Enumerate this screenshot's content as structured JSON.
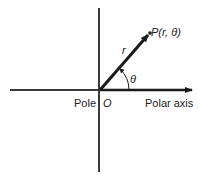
{
  "diagram": {
    "labels": {
      "point": "P(r, θ)",
      "radius": "r",
      "angle": "θ",
      "pole": "Pole",
      "origin": "O",
      "polar_axis": "Polar axis"
    },
    "colors": {
      "line": "#1a1a1a",
      "axis": "#3a3a3a",
      "background": "#ffffff"
    }
  }
}
